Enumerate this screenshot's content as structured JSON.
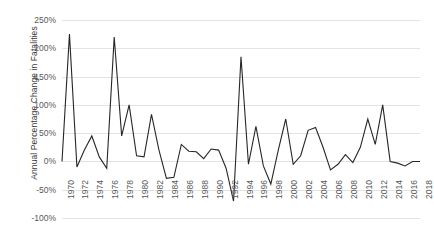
{
  "chart_data": {
    "type": "line",
    "title": "",
    "xlabel": "",
    "ylabel": "Annual Percentage Change in Fatalities",
    "ylim": [
      -100,
      250
    ],
    "ytick_labels": [
      "250%",
      "200%",
      "150%",
      "100%",
      "50%",
      "0%",
      "-50%",
      "-100%"
    ],
    "ytick_values": [
      250,
      200,
      150,
      100,
      50,
      0,
      -50,
      -100
    ],
    "xlim": [
      1970,
      2018
    ],
    "xtick_labels": [
      "1970",
      "1972",
      "1974",
      "1976",
      "1978",
      "1980",
      "1982",
      "1984",
      "1986",
      "1988",
      "1990",
      "1992",
      "1994",
      "1996",
      "1998",
      "2000",
      "2002",
      "2004",
      "2006",
      "2008",
      "2010",
      "2012",
      "2014",
      "2016",
      "2018"
    ],
    "xtick_values": [
      1970,
      1972,
      1974,
      1976,
      1978,
      1980,
      1982,
      1984,
      1986,
      1988,
      1990,
      1992,
      1994,
      1996,
      1998,
      2000,
      2002,
      2004,
      2006,
      2008,
      2010,
      2012,
      2014,
      2016,
      2018
    ],
    "grid": true,
    "grid_axis": "y",
    "legend": false,
    "legend_position": "none",
    "line_color": "#262626",
    "x": [
      1970,
      1971,
      1972,
      1973,
      1974,
      1975,
      1976,
      1977,
      1978,
      1979,
      1980,
      1981,
      1982,
      1983,
      1984,
      1985,
      1986,
      1987,
      1988,
      1989,
      1990,
      1991,
      1992,
      1993,
      1994,
      1995,
      1996,
      1997,
      1998,
      1999,
      2000,
      2001,
      2002,
      2003,
      2004,
      2005,
      2006,
      2007,
      2008,
      2009,
      2010,
      2011,
      2012,
      2013,
      2014,
      2015,
      2016,
      2017,
      2018
    ],
    "values": [
      0,
      225,
      -10,
      20,
      45,
      8,
      -12,
      220,
      45,
      100,
      10,
      8,
      83,
      20,
      -30,
      -28,
      30,
      18,
      17,
      5,
      22,
      20,
      -12,
      -70,
      185,
      -5,
      62,
      -8,
      -40,
      20,
      75,
      -5,
      10,
      55,
      60,
      25,
      -15,
      -5,
      12,
      -2,
      25,
      75,
      30,
      100,
      0,
      -3,
      -8,
      0,
      0
    ],
    "series": [
      {
        "name": "Annual Percentage Change in Fatalities",
        "values": [
          0,
          225,
          -10,
          20,
          45,
          8,
          -12,
          220,
          45,
          100,
          10,
          8,
          83,
          20,
          -30,
          -28,
          30,
          18,
          17,
          5,
          22,
          20,
          -12,
          -70,
          185,
          -5,
          62,
          -8,
          -40,
          20,
          75,
          -5,
          10,
          55,
          60,
          25,
          -15,
          -5,
          12,
          -2,
          25,
          75,
          30,
          100,
          0,
          -3,
          -8,
          0,
          0
        ]
      }
    ]
  },
  "axes": {
    "y_title": "Annual Percentage Change in Fatalities"
  }
}
